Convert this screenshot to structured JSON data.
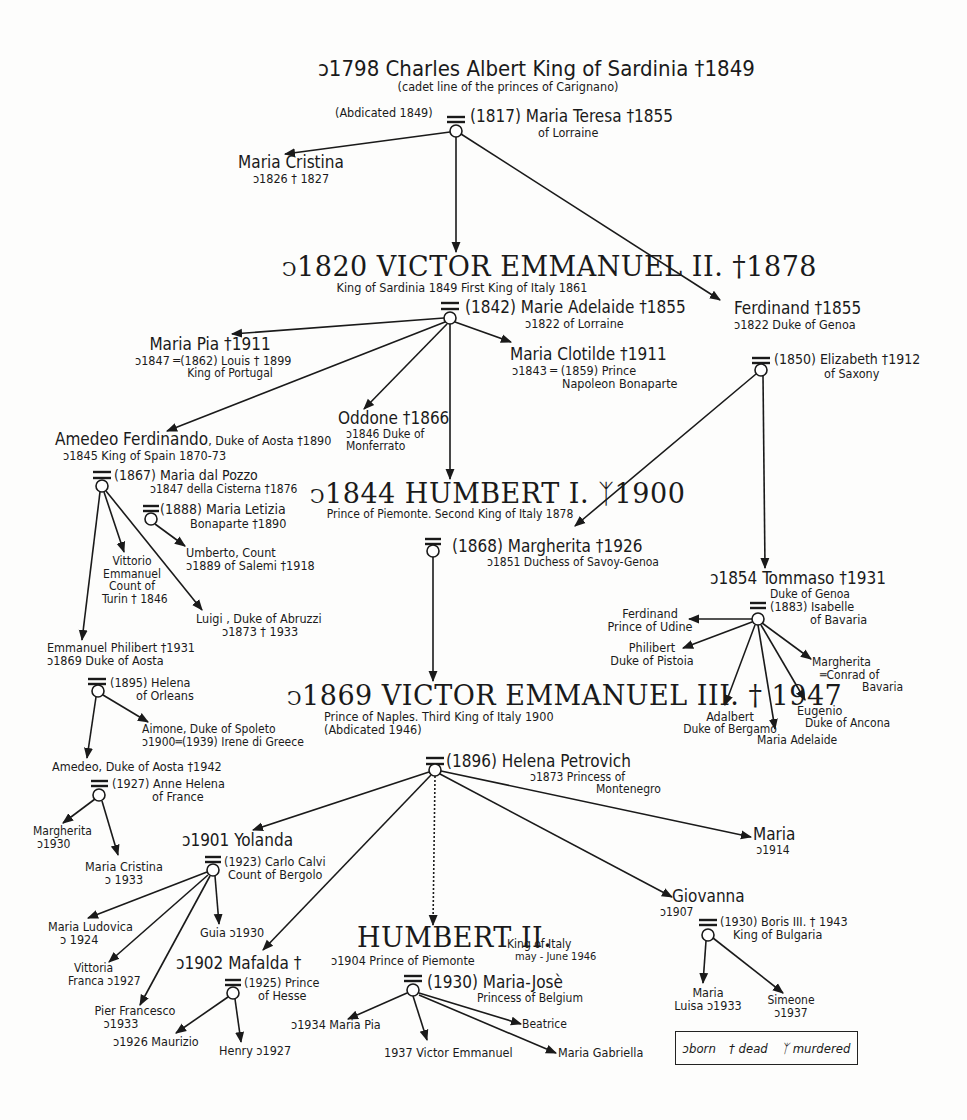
{
  "symbols": {
    "born": "ↄ",
    "dead": "†",
    "murdered": "⚔",
    "married": "═"
  },
  "legend": {
    "born": "ↄborn",
    "dead": "† dead",
    "murdered": "ᛉ murdered"
  },
  "people": {
    "charles_albert": {
      "line1": "ↄ1798 Charles Albert  King of Sardinia †1849",
      "line2": "(cadet line of the princes of Carignano)",
      "line3": "(Abdicated 1849)"
    },
    "maria_teresa": {
      "line1": "(1817) Maria Teresa †1855",
      "line2": "of Lorraine"
    },
    "maria_cristina_1826": {
      "line1": "Maria Cristina",
      "line2": "ↄ1826     † 1827"
    },
    "victor_emmanuel_ii": {
      "line1": "ↄ1820 VICTOR EMMANUEL II. †1878",
      "line2": "King of Sardinia 1849 First King of Italy 1861"
    },
    "marie_adelaide": {
      "line1": "(1842) Marie Adelaide †1855",
      "line2": "ↄ1822  of Lorraine"
    },
    "ferdinand_genoa": {
      "line1": "Ferdinand †1855",
      "line2": "ↄ1822 Duke of Genoa"
    },
    "elizabeth_saxony": {
      "line1": "(1850) Elizabeth †1912",
      "line2": "of Saxony"
    },
    "maria_pia_1847": {
      "line1": "Maria Pia †1911",
      "line2": "ↄ1847 ═(1862) Louis † 1899",
      "line3": "King of Portugal"
    },
    "maria_clotilde": {
      "line1": "Maria Clotilde †1911",
      "line2": "ↄ1843 ═ (1859) Prince",
      "line3": "Napoleon Bonaparte"
    },
    "oddone": {
      "line1": "Oddone †1866",
      "line2": "ↄ1846 Duke of",
      "line3": "Monferrato"
    },
    "amedeo_ferdinando": {
      "line1": "Amedeo Ferdinando",
      "line1b": ", Duke of Aosta †1890",
      "line2": "ↄ1845  King of Spain  1870-73"
    },
    "maria_dal_pozzo": {
      "line1": "(1867) Maria dal Pozzo",
      "line2": "ↄ1847 della Cisterna †1876"
    },
    "maria_letizia": {
      "line1": "(1888) Maria Letizia",
      "line2": "Bonaparte †1890"
    },
    "umberto_salemi": {
      "line1": "Umberto, Count",
      "line2": "ↄ1889    of Salemi †1918"
    },
    "vittorio_emmanuel_turin": {
      "line1": "Vittorio",
      "line2": "Emmanuel",
      "line3": "Count of",
      "line4": "Turin † 1846"
    },
    "luigi_abruzzi": {
      "line1": "Luigi , Duke of Abruzzi",
      "line2": "ↄ1873        † 1933"
    },
    "humbert_i": {
      "line1": "ↄ1844 HUMBERT I. ᛉ1900",
      "line2": "Prince of Piemonte. Second King of Italy 1878"
    },
    "margherita_1851": {
      "line1": "(1868) Margherita †1926",
      "line2": "ↄ1851  Duchess of Savoy-Genoa"
    },
    "tommaso": {
      "line1": "ↄ1854 Tommaso †1931",
      "line2": "Duke of Genoa"
    },
    "isabelle_bavaria": {
      "line1": "(1883) Isabelle",
      "line2": "of Bavaria"
    },
    "ferdinand_udine": {
      "line1": "Ferdinand",
      "line2": "Prince of Udine"
    },
    "philibert_pistoia": {
      "line1": "Philibert",
      "line2": "Duke of Pistoia"
    },
    "margherita_tommaso": {
      "line1": "Margherita",
      "line2": "═Conrad of",
      "line3": "Bavaria"
    },
    "adalbert": {
      "line1": "Adalbert",
      "line2": "Duke of Bergamo"
    },
    "maria_adelaide_tommaso": {
      "line1": "Maria Adelaide"
    },
    "eugenio": {
      "line1": "Eugenio",
      "line2": "Duke of Ancona"
    },
    "emmanuel_philibert": {
      "line1": "Emmanuel Philibert †1931",
      "line2": "ↄ1869  Duke of Aosta"
    },
    "helena_orleans": {
      "line1": "(1895) Helena",
      "line2": "of Orleans"
    },
    "aimone": {
      "line1": "Aimone, Duke of Spoleto",
      "line2": "ↄ1900═(1939) Irene di Greece"
    },
    "amedeo_aosta": {
      "line1": "Amedeo, Duke of Aosta †1942"
    },
    "anne_helena": {
      "line1": "(1927)  Anne Helena",
      "line2": "of France"
    },
    "margherita_1930": {
      "line1": "Margherita",
      "line2": "ↄ1930"
    },
    "maria_cristina_1933": {
      "line1": "Maria Cristina",
      "line2": "ↄ 1933"
    },
    "victor_emmanuel_iii": {
      "line1": "ↄ1869 VICTOR EMMANUEL III. † 1947",
      "line2": "Prince of Naples. Third King of Italy 1900",
      "line3": "(Abdicated 1946)"
    },
    "helena_petrovich": {
      "line1": "(1896) Helena Petrovich",
      "line2": "ↄ1873 Princess of",
      "line3": "Montenegro"
    },
    "yolanda": {
      "line1": "ↄ1901 Yolanda",
      "line2": "(1923) Carlo Calvi",
      "line3": "Count of Bergolo"
    },
    "maria_ludovica": {
      "line1": "Maria Ludovica",
      "line2": "ↄ 1924"
    },
    "guia": {
      "line1": "Guia ↄ1930"
    },
    "vittoria_franca": {
      "line1": "Vittoria",
      "line2": "Franca ↄ1927"
    },
    "pier_francesco": {
      "line1": "Pier Francesco",
      "line2": "ↄ1933"
    },
    "mafalda": {
      "line1": "ↄ1902 Mafalda †",
      "line2": "(1925) Prince",
      "line3": "of Hesse"
    },
    "maurizio": {
      "line1": "ↄ1926 Maurizio"
    },
    "henry": {
      "line1": "Henry ↄ1927"
    },
    "humbert_ii": {
      "line1": "HUMBERT II.",
      "line1b": "King of Italy",
      "line1c": "may - June 1946",
      "line2": "ↄ1904  Prince of Piemonte"
    },
    "maria_jose": {
      "line1": "(1930) Maria-Josè",
      "line2": "Princess of Belgium"
    },
    "maria_pia_1934": {
      "line1": "ↄ1934 Maria Pia"
    },
    "victor_emmanuel_1937": {
      "line1": "1937 Victor Emmanuel"
    },
    "beatrice": {
      "line1": "Beatrice"
    },
    "maria_gabriella": {
      "line1": "Maria Gabriella"
    },
    "maria_1914": {
      "line1": "Maria",
      "line2": "ↄ1914"
    },
    "giovanna": {
      "line1": "Giovanna",
      "line2": "ↄ1907"
    },
    "boris_iii": {
      "line1": "(1930) Boris III. † 1943",
      "line2": "King of Bulgaria"
    },
    "maria_luisa": {
      "line1": "Maria",
      "line2": "Luisa ↄ1933"
    },
    "simeone": {
      "line1": "Simeone",
      "line2": "ↄ1937"
    }
  }
}
